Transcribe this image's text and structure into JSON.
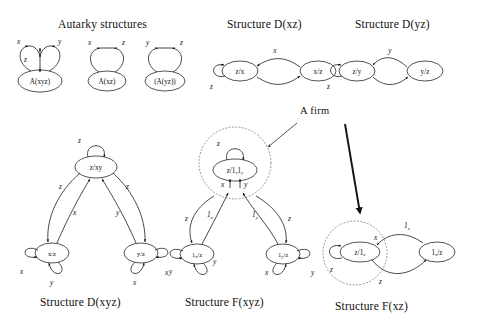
{
  "figure": {
    "background_color": "#ffffff",
    "ink_color": "#1b1b1b",
    "dotted_color": "#8a8a8a"
  },
  "headings": {
    "autarky": "Autarky structures",
    "d_xz": "Structure D(xz)",
    "d_yz": "Structure D(yz)"
  },
  "captions": {
    "d_xyz": "Structure D(xyz)",
    "f_xyz": "Structure F(xyz)",
    "f_xz": "Structure F(xz)"
  },
  "annotation": {
    "a_firm": "A firm"
  },
  "autarky": {
    "graph1": {
      "node": "A(xyz)",
      "loop_left_label": "x",
      "loop_right_label": "y",
      "vertical_label": "z"
    },
    "graph2": {
      "node": "A(xz)",
      "loop_left_label": "x",
      "loop_right_label": "z"
    },
    "graph3": {
      "node": "(A(yz))",
      "loop_left_label": "y",
      "loop_right_label": "z"
    }
  },
  "d_xz": {
    "node_left": "z/x",
    "node_right": "x/z",
    "edge_top_label": "x",
    "selfloop_label": "z"
  },
  "d_yz": {
    "node_left": "z/y",
    "node_right": "y/z",
    "edge_top_label": "y",
    "selfloop_label": "z"
  },
  "d_xyz": {
    "node_top": "z/xy",
    "node_bottom_left": "x/z",
    "node_bottom_right": "y/z",
    "selfloop_top_label": "z",
    "edge_left_outer_label": "z",
    "edge_left_inner_label": "x",
    "edge_right_inner_label": "y",
    "edge_right_outer_label": "z",
    "left_loop_label_1": "x",
    "left_loop_label_2": "y",
    "right_loop_label_1": "x",
    "right_loop_label_2": "y"
  },
  "f_xyz": {
    "node_top": "z/1",
    "node_top_sub1": "x",
    "node_top_sub2": "1",
    "node_top_sub3": "y",
    "node_top_full": "z/1x1y",
    "node_bottom_left": "1",
    "node_bottom_left_sub": "x",
    "node_bottom_left_rest": "/z",
    "node_bottom_right": "1",
    "node_bottom_right_sub": "y",
    "node_bottom_right_rest": "/z",
    "selfloop_top_label": "z",
    "arrow_top_left_label": "x",
    "arrow_top_right_label": "y",
    "edge_left_outer_label": "z",
    "edge_right_outer_label": "z",
    "edge_left_inner_label": "1",
    "edge_left_inner_sub": "x",
    "edge_right_inner_label": "1",
    "edge_right_inner_sub": "y",
    "left_loop_label_1": "x",
    "left_loop_label_2": "y",
    "right_loop_label_1": "x",
    "right_loop_label_2": "y"
  },
  "f_xz": {
    "node_left": "z/1",
    "node_left_sub": "x",
    "node_right": "1",
    "node_right_sub": "x",
    "node_right_rest": "/z",
    "selfloop_label": "z",
    "edge_top_label": "1",
    "edge_top_sub": "x",
    "edge_bottom_label": "z",
    "arrow_in_label": "x"
  }
}
